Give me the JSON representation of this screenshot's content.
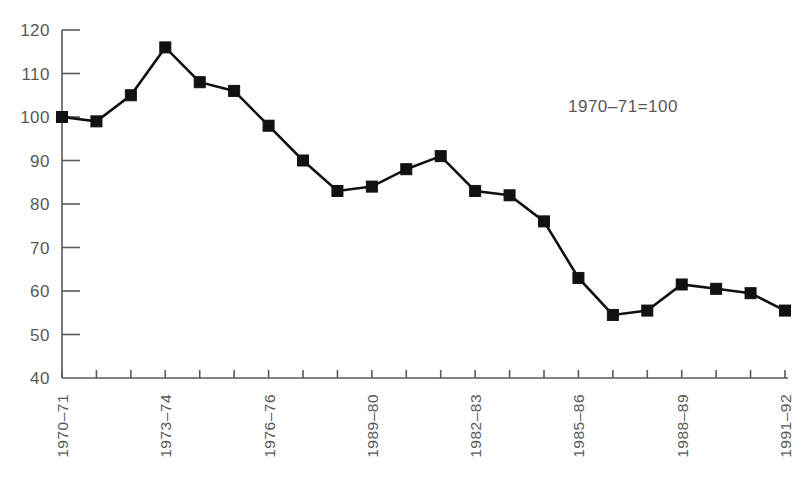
{
  "chart_data": {
    "type": "line",
    "title": "",
    "subtitle": "",
    "xlabel": "",
    "ylabel": "",
    "annotation": "1970–71=100",
    "grid": false,
    "legend": "none",
    "ylim": [
      40,
      120
    ],
    "ytick_values": [
      40,
      50,
      60,
      70,
      80,
      90,
      100,
      110,
      120
    ],
    "ytick_labels": [
      "40",
      "50",
      "60",
      "70",
      "80",
      "90",
      "100",
      "110",
      "120"
    ],
    "x_tick_count": 22,
    "xtick_labels": [
      "1970–71",
      "",
      "",
      "1973–74",
      "",
      "",
      "1976–76",
      "",
      "",
      "1989–80",
      "",
      "",
      "1982–83",
      "",
      "",
      "1985–86",
      "",
      "",
      "1988–89",
      "",
      "",
      "1991–92"
    ],
    "xtick_labels_shown": [
      "1970–71",
      "1973–74",
      "1976–76",
      "1989–80",
      "1982–83",
      "1985–86",
      "1988–89",
      "1991–92"
    ],
    "categories": [
      "1970–71",
      "1971–72",
      "1972–73",
      "1973–74",
      "1974–75",
      "1975–76",
      "1976–76",
      "1977–78",
      "1978–79",
      "1989–80",
      "1980–81",
      "1981–82",
      "1982–83",
      "1983–84",
      "1984–85",
      "1985–86",
      "1986–87",
      "1987–88",
      "1988–89",
      "1989–90",
      "1990–91",
      "1991–92"
    ],
    "values": [
      100,
      99,
      105,
      116,
      108,
      106,
      98,
      90,
      83,
      84,
      88,
      91,
      83,
      82,
      76,
      63,
      54.5,
      55.5,
      61.5,
      60.5,
      59.5,
      55.5
    ],
    "series": [
      {
        "name": "index",
        "values": [
          100,
          99,
          105,
          116,
          108,
          106,
          98,
          90,
          83,
          84,
          88,
          91,
          83,
          82,
          76,
          63,
          54.5,
          55.5,
          61.5,
          60.5,
          59.5,
          55.5
        ]
      }
    ],
    "marker": "square",
    "line_color": "#111111",
    "marker_color": "#111111",
    "axis_color": "#5a5a5a",
    "label_color": "#595959",
    "background_color": "#ffffff"
  }
}
